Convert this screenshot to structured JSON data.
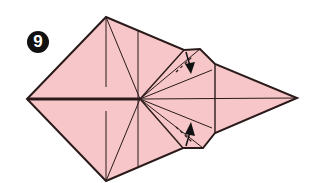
{
  "step": {
    "number": "9"
  },
  "colors": {
    "paper": "#f7c6c8",
    "line": "#2a1a1a",
    "badge": "#111111",
    "badge_text": "#ffffff"
  },
  "diagram": {
    "arrows": [
      {
        "name": "upper-fold-arrow",
        "direction": "down"
      },
      {
        "name": "lower-fold-arrow",
        "direction": "up"
      }
    ]
  }
}
